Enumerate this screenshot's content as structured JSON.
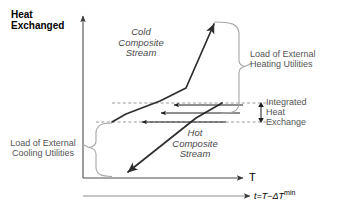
{
  "figure": {
    "title_axis_y": "Heat\nExchanged",
    "axis_x_label": "T",
    "axis_x2_label_main": "t=T−ΔT",
    "axis_x2_label_sup": "min"
  },
  "labels": {
    "cold_stream": "Cold\nComposite\nStream",
    "hot_stream": "Hot\nComposite\nStream",
    "heating_utilities": "Load of External\nHeating Utilities",
    "cooling_utilities": "Load of External\nCooling Utilities",
    "integrated_exchange": "Integrated\nHeat\nExchange"
  },
  "colors": {
    "curve": "#3a3a3a",
    "dashed": "#8a8a8a",
    "brace": "#9a9a9a",
    "axis": "#5a5a5a",
    "text_dark": "#000000",
    "text_gray": "#555555",
    "background": "#ffffff"
  },
  "chart_data": {
    "type": "line",
    "xlabel": "T",
    "ylabel": "Heat Exchanged",
    "grid": false,
    "legend": "none",
    "series": [
      {
        "name": "Cold Composite Stream",
        "arrow": "end",
        "points": [
          [
            64,
            165
          ],
          [
            125,
            126
          ],
          [
            160,
            116
          ],
          [
            186,
            103
          ],
          [
            211,
            22
          ]
        ]
      },
      {
        "name": "Hot Composite Stream",
        "arrow": "end",
        "points": [
          [
            218,
            103
          ],
          [
            192,
            118
          ],
          [
            127,
            172
          ]
        ]
      }
    ],
    "dashed_levels": [
      {
        "name": "upper-pinch-level",
        "y": 103,
        "x0": 108,
        "x1": 270
      },
      {
        "name": "lower-pinch-level",
        "y": 122,
        "x0": 95,
        "x1": 270
      }
    ],
    "transfer_arrows": [
      {
        "y": 105,
        "x0": 243,
        "x1": 172,
        "direction": "left"
      },
      {
        "y": 113,
        "x0": 240,
        "x1": 160,
        "direction": "left"
      },
      {
        "y": 122,
        "x0": 225,
        "x1": 140,
        "direction": "left"
      }
    ],
    "annotations": [
      {
        "label": "Load of External Heating Utilities",
        "span_y": [
          22,
          113
        ],
        "side": "right"
      },
      {
        "label": "Integrated Heat Exchange",
        "span_y": [
          103,
          122
        ],
        "side": "right"
      },
      {
        "label": "Load of External Cooling Utilities",
        "span_y": [
          123,
          176
        ],
        "side": "left"
      }
    ]
  }
}
